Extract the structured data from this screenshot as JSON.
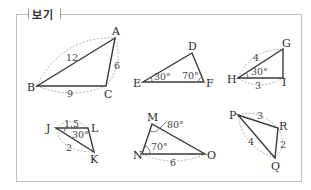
{
  "header": {
    "title": "보기"
  },
  "triangles": [
    {
      "id": "ABC",
      "vertices": {
        "A": "A",
        "B": "B",
        "C": "C"
      },
      "sides": {
        "AB": "12",
        "AC": "6",
        "BC": "9"
      },
      "angles": {}
    },
    {
      "id": "DEF",
      "vertices": {
        "D": "D",
        "E": "E",
        "F": "F"
      },
      "sides": {},
      "angles": {
        "E": "30°",
        "F": "70°"
      }
    },
    {
      "id": "GHI",
      "vertices": {
        "G": "G",
        "H": "H",
        "I": "I"
      },
      "sides": {
        "HG": "4",
        "HI": "3"
      },
      "angles": {
        "H": "30°"
      }
    },
    {
      "id": "JKL",
      "vertices": {
        "J": "J",
        "K": "K",
        "L": "L"
      },
      "sides": {
        "JL": "1.5",
        "JK": "2"
      },
      "angles": {
        "J": "30°"
      }
    },
    {
      "id": "MNO",
      "vertices": {
        "M": "M",
        "N": "N",
        "O": "O"
      },
      "sides": {
        "NO": "6"
      },
      "angles": {
        "M": "80°",
        "N": "70°"
      }
    },
    {
      "id": "PQR",
      "vertices": {
        "P": "P",
        "Q": "Q",
        "R": "R"
      },
      "sides": {
        "PR": "3",
        "RQ": "2",
        "PQ": "4"
      },
      "angles": {}
    }
  ]
}
